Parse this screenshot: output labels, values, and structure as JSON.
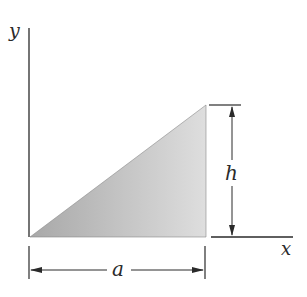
{
  "diagram": {
    "type": "geometry-figure",
    "axes": {
      "x_label": "x",
      "y_label": "y"
    },
    "dimensions": {
      "base_label": "a",
      "height_label": "h"
    },
    "colors": {
      "line": "#2a2a2a",
      "fill_light": "#d9d9d9",
      "fill_dark": "#a9a9a9"
    }
  }
}
